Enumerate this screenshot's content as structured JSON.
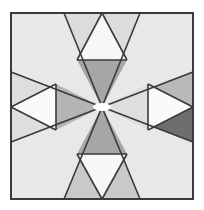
{
  "figure": {
    "canvas": {
      "width": 204,
      "height": 210
    },
    "frame": {
      "name": "outer-frame",
      "x": 11,
      "y": 13,
      "width": 182,
      "height": 186,
      "border_color": "#3a3a3a",
      "border_width": 2,
      "background_color": "#e8e8e8"
    },
    "center_point": {
      "x": 102,
      "y": 107
    },
    "palette": {
      "background": "#e8e8e8",
      "white": "#fbfbfb",
      "light_gray": "#e2e2e2",
      "mid_light_gray": "#d2d2d2",
      "mid_gray": "#b0b0b0",
      "gray": "#a8a8a8",
      "dark_gray": "#8f8f8f",
      "darkest_gray": "#6e6e6e",
      "outline": "#3a3a3a",
      "frame_border": "#3a3a3a"
    },
    "shapes": [
      {
        "name": "top-left-wedge",
        "type": "polygon",
        "points": "102,107 64,13 102,13",
        "fill": "#dcdcdc"
      },
      {
        "name": "top-right-wedge",
        "type": "polygon",
        "points": "102,107 102,13 140,13",
        "fill": "#dcdcdc"
      },
      {
        "name": "top-inner-down-triangle",
        "type": "polygon",
        "points": "77,60 127,60 102,107",
        "fill": "#a6a6a6"
      },
      {
        "name": "top-white-up-triangle",
        "type": "polygon",
        "points": "102,13 127,60 77,60",
        "fill": "#f7f7f7"
      },
      {
        "name": "bottom-left-wedge",
        "type": "polygon",
        "points": "102,107 64,199 102,199",
        "fill": "#c9c9c9"
      },
      {
        "name": "bottom-right-wedge",
        "type": "polygon",
        "points": "102,107 102,199 140,199",
        "fill": "#c9c9c9"
      },
      {
        "name": "bottom-inner-up-triangle",
        "type": "polygon",
        "points": "77,154 127,154 102,107",
        "fill": "#a6a6a6"
      },
      {
        "name": "bottom-white-down-triangle",
        "type": "polygon",
        "points": "102,199 77,154 127,154",
        "fill": "#f7f7f7"
      },
      {
        "name": "left-upper-wedge",
        "type": "polygon",
        "points": "102,107 11,72 11,107",
        "fill": "#dedede"
      },
      {
        "name": "left-lower-wedge",
        "type": "polygon",
        "points": "102,107 11,107 11,142",
        "fill": "#dedede"
      },
      {
        "name": "left-inner-right-triangle",
        "type": "polygon",
        "points": "56,84 56,130 102,107",
        "fill": "#b4b4b4"
      },
      {
        "name": "left-white-left-triangle",
        "type": "polygon",
        "points": "11,107 56,84 56,130",
        "fill": "#fafafa"
      },
      {
        "name": "right-upper-wedge",
        "type": "polygon",
        "points": "102,107 193,72 193,107",
        "fill": "#b9b9b9"
      },
      {
        "name": "right-lower-wedge",
        "type": "polygon",
        "points": "102,107 193,107 193,142",
        "fill": "#6e6e6e"
      },
      {
        "name": "right-inner-left-triangle",
        "type": "polygon",
        "points": "148,84 148,130 102,107",
        "fill": "#dedede"
      },
      {
        "name": "right-white-right-triangle",
        "type": "polygon",
        "points": "193,107 148,84 148,130",
        "fill": "#fafafa"
      }
    ],
    "outlines": [
      {
        "name": "edge-center-to-top-left-corner",
        "x1": 102,
        "y1": 107,
        "x2": 64,
        "y2": 13
      },
      {
        "name": "edge-center-to-top-right-corner",
        "x1": 102,
        "y1": 107,
        "x2": 140,
        "y2": 13
      },
      {
        "name": "edge-top-triangle-left",
        "x1": 102,
        "y1": 13,
        "x2": 77,
        "y2": 60
      },
      {
        "name": "edge-top-triangle-right",
        "x1": 102,
        "y1": 13,
        "x2": 127,
        "y2": 60
      },
      {
        "name": "edge-top-triangle-base",
        "x1": 77,
        "y1": 60,
        "x2": 127,
        "y2": 60
      },
      {
        "name": "edge-center-to-bottom-left-corner",
        "x1": 102,
        "y1": 107,
        "x2": 64,
        "y2": 199
      },
      {
        "name": "edge-center-to-bottom-right-corner",
        "x1": 102,
        "y1": 107,
        "x2": 140,
        "y2": 199
      },
      {
        "name": "edge-bottom-triangle-left",
        "x1": 102,
        "y1": 199,
        "x2": 77,
        "y2": 154
      },
      {
        "name": "edge-bottom-triangle-right",
        "x1": 102,
        "y1": 199,
        "x2": 127,
        "y2": 154
      },
      {
        "name": "edge-bottom-triangle-base",
        "x1": 77,
        "y1": 154,
        "x2": 127,
        "y2": 154
      },
      {
        "name": "edge-center-to-left-upper",
        "x1": 102,
        "y1": 107,
        "x2": 11,
        "y2": 72
      },
      {
        "name": "edge-center-to-left-lower",
        "x1": 102,
        "y1": 107,
        "x2": 11,
        "y2": 142
      },
      {
        "name": "edge-left-triangle-upper",
        "x1": 11,
        "y1": 107,
        "x2": 56,
        "y2": 84
      },
      {
        "name": "edge-left-triangle-lower",
        "x1": 11,
        "y1": 107,
        "x2": 56,
        "y2": 130
      },
      {
        "name": "edge-left-triangle-base",
        "x1": 56,
        "y1": 84,
        "x2": 56,
        "y2": 130
      },
      {
        "name": "edge-center-to-right-upper",
        "x1": 102,
        "y1": 107,
        "x2": 193,
        "y2": 72
      },
      {
        "name": "edge-center-to-right-lower",
        "x1": 102,
        "y1": 107,
        "x2": 193,
        "y2": 142
      },
      {
        "name": "edge-right-triangle-upper",
        "x1": 193,
        "y1": 107,
        "x2": 148,
        "y2": 84
      },
      {
        "name": "edge-right-triangle-lower",
        "x1": 193,
        "y1": 107,
        "x2": 148,
        "y2": 130
      },
      {
        "name": "edge-right-triangle-base",
        "x1": 148,
        "y1": 84,
        "x2": 148,
        "y2": 130
      }
    ],
    "center_highlight": {
      "name": "center-highlight",
      "cx": 102,
      "cy": 107,
      "rx": 9,
      "ry": 4,
      "fill": "#ffffff"
    }
  }
}
